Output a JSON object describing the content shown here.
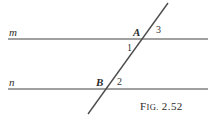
{
  "figure": {
    "caption": {
      "prefix_lead": "F",
      "prefix_smallcaps": "IG.",
      "number": "2.52",
      "full_text": "FIG. 2.52"
    },
    "stroke_color": "#808080",
    "transversal_color": "#4d4d4d",
    "text_color": "#2b2b2b",
    "background_color": "#ffffff",
    "lines": [
      {
        "name": "m",
        "label": "m",
        "role": "upper-parallel-line",
        "x1": 8,
        "y1": 39,
        "x2": 208,
        "y2": 39
      },
      {
        "name": "n",
        "label": "n",
        "role": "lower-parallel-line",
        "x1": 8,
        "y1": 89,
        "x2": 208,
        "y2": 89
      },
      {
        "name": "t",
        "label": "",
        "role": "transversal-line",
        "x1": 168,
        "y1": 3,
        "x2": 88,
        "y2": 114
      }
    ],
    "line_labels": [
      {
        "text": "m",
        "x": 9,
        "y": 27
      },
      {
        "text": "n",
        "x": 9,
        "y": 77
      }
    ],
    "points": [
      {
        "text": "A",
        "x": 133,
        "y": 27
      },
      {
        "text": "B",
        "x": 96,
        "y": 77
      }
    ],
    "angles": [
      {
        "text": "1",
        "x": 127,
        "y": 43
      },
      {
        "text": "2",
        "x": 117,
        "y": 77
      },
      {
        "text": "3",
        "x": 156,
        "y": 25
      }
    ]
  }
}
